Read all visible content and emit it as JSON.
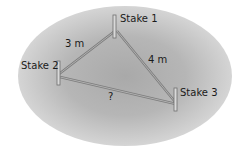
{
  "diagram": {
    "stakes": [
      {
        "label": "Stake 1"
      },
      {
        "label": "Stake 2"
      },
      {
        "label": "Stake 3"
      }
    ],
    "edges": [
      {
        "from": "Stake 2",
        "to": "Stake 1",
        "label": "3 m"
      },
      {
        "from": "Stake 1",
        "to": "Stake 3",
        "label": "4 m"
      },
      {
        "from": "Stake 2",
        "to": "Stake 3",
        "label": "?"
      }
    ],
    "colors": {
      "ground": "#b0b0b0",
      "rope": "#8a8a8a",
      "stake": "#6f6f6f",
      "text": "#1a1a1a"
    }
  }
}
